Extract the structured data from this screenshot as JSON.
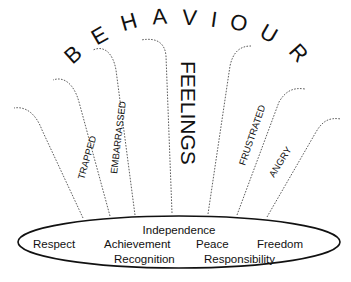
{
  "title": {
    "word": "BEHAVIOUR",
    "letters": [
      "B",
      "E",
      "H",
      "A",
      "V",
      "I",
      "O",
      "U",
      "R"
    ]
  },
  "center_label": "FEELINGS",
  "feelings": [
    {
      "label": "TRAPPED"
    },
    {
      "label": "EMBARRASSED"
    },
    {
      "label": "FRUSTRATED"
    },
    {
      "label": "ANGRY"
    }
  ],
  "needs": {
    "row1": [
      "Independence"
    ],
    "row2": [
      "Respect",
      "Achievement",
      "Peace",
      "Freedom"
    ],
    "row3": [
      "Recognition",
      "Responsibility"
    ]
  },
  "colors": {
    "ink": "#111111",
    "background": "#ffffff"
  }
}
